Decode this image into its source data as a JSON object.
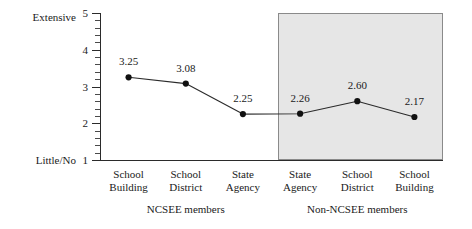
{
  "chart_data": {
    "type": "line",
    "title": "",
    "xlabel": "",
    "ylabel": "",
    "ylim": [
      1,
      5
    ],
    "grid": false,
    "legend": "none",
    "y_axis": {
      "tick_labels": [
        "1",
        "2",
        "3",
        "4",
        "5"
      ],
      "tick_values": [
        1,
        2,
        3,
        4,
        5
      ],
      "low_anchor_label": "Little/No",
      "high_anchor_label": "Extensive",
      "minor_ticks_per_interval": 4
    },
    "categories": [
      "School\nBuilding",
      "School\nDistrict",
      "State\nAgency",
      "State\nAgency",
      "School\nDistrict",
      "School\nBuilding"
    ],
    "values": [
      3.25,
      3.08,
      2.25,
      2.26,
      2.6,
      2.17
    ],
    "value_labels": [
      "3.25",
      "3.08",
      "2.25",
      "2.26",
      "2.60",
      "2.17"
    ],
    "groups": [
      {
        "label": "NCSEE members",
        "category_indices": [
          0,
          1,
          2
        ],
        "shaded": false
      },
      {
        "label": "Non-NCSEE members",
        "category_indices": [
          3,
          4,
          5
        ],
        "shaded": true
      }
    ],
    "annotations": [
      {
        "type": "shaded-region",
        "covers_group": "Non-NCSEE members",
        "color": "#e6e6e6"
      }
    ],
    "colors": {
      "line": "#2b2b2b",
      "marker": "#111111",
      "axis": "#2b2b2b",
      "shaded_region": "#e6e6e6",
      "shaded_border": "#8a8a8a",
      "text": "#1a1a1a"
    }
  }
}
